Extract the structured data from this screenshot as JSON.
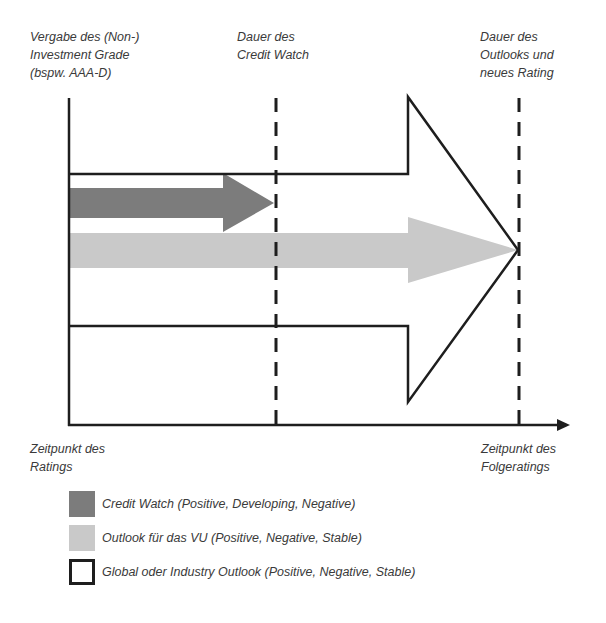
{
  "labels": {
    "top_left": [
      "Vergabe des (Non-)",
      "Investment Grade",
      "(bspw. AAA-D)"
    ],
    "top_middle": [
      "Dauer des",
      "Credit Watch"
    ],
    "top_right": [
      "Dauer des",
      "Outlooks und",
      "neues Rating"
    ],
    "bottom_left": [
      "Zeitpunkt des",
      "Ratings"
    ],
    "bottom_right": [
      "Zeitpunkt des",
      "Folgeratings"
    ]
  },
  "legend": [
    {
      "swatch": "dark-gray-fill",
      "color": "#7c7c7c",
      "label": "Credit Watch (Positive, Developing, Negative)"
    },
    {
      "swatch": "light-gray-fill",
      "color": "#c9c9c9",
      "label": "Outlook für das VU (Positive, Negative, Stable)"
    },
    {
      "swatch": "outline",
      "color": "#1e1e1e",
      "label": "Global oder Industry Outlook (Positive, Negative, Stable)"
    }
  ],
  "colors": {
    "credit_watch_arrow": "#7c7c7c",
    "outlook_vu_arrow": "#c9c9c9",
    "outline": "#1e1e1e",
    "text": "#3a3a3a"
  },
  "diagram": {
    "time_axis": "horizontal arrow from Zeitpunkt des Ratings to Zeitpunkt des Folgeratings",
    "markers": [
      "Dauer des Credit Watch (dashed)",
      "Dauer des Outlooks und neues Rating (dashed)"
    ],
    "arrows": [
      {
        "name": "Credit Watch",
        "style": "dark gray filled",
        "ends_at": "Dauer des Credit Watch"
      },
      {
        "name": "Outlook für das VU",
        "style": "light gray filled",
        "ends_at": "Dauer des Outlooks und neues Rating"
      },
      {
        "name": "Global oder Industry Outlook",
        "style": "black outline",
        "ends_at": "Dauer des Outlooks und neues Rating"
      }
    ]
  }
}
